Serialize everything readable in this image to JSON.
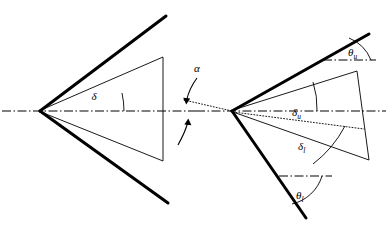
{
  "figure": {
    "background_color": "#ffffff",
    "line_color": "#000000",
    "canvas": {
      "width": 388,
      "height": 237
    }
  },
  "labels": {
    "delta": "δ",
    "alpha": "α",
    "delta_u_base": "δ",
    "delta_u_sub": "u",
    "delta_l_base": "δ",
    "delta_l_sub": "l",
    "theta_u_base": "θ",
    "theta_u_sub": "u",
    "theta_l_base": "θ",
    "theta_l_sub": "l"
  },
  "left_wedge": {
    "name": "symmetric-wedge",
    "apex": {
      "x": 40,
      "y": 111
    },
    "upper_surface_end": {
      "x": 166,
      "y": 16
    },
    "lower_surface_end": {
      "x": 168,
      "y": 203
    },
    "shock_upper_end": {
      "x": 163,
      "y": 57
    },
    "shock_lower_end": {
      "x": 163,
      "y": 161
    },
    "shock_closing_line": {
      "x": 163,
      "y1": 57,
      "y2": 161
    },
    "angle_label": "δ",
    "angle_arc_radius": 82,
    "axis_line": {
      "x1": 2,
      "y1": 111,
      "x2": 386,
      "y2": 111
    }
  },
  "alpha_marker": {
    "name": "angle-of-attack",
    "label": "α",
    "label_position": {
      "x": 196,
      "y": 69
    },
    "upper_arrow_tip": {
      "x": 186,
      "y": 101
    },
    "lower_arrow_tip": {
      "x": 188,
      "y": 121
    },
    "vertex": {
      "x": 196,
      "y": 111
    }
  },
  "right_wedge": {
    "name": "wedge-at-angle-of-attack",
    "apex": {
      "x": 232,
      "y": 111
    },
    "upper_surface_end": {
      "x": 369,
      "y": 34
    },
    "lower_surface_end": {
      "x": 306,
      "y": 218
    },
    "shock_upper_end": {
      "x": 357,
      "y": 71
    },
    "shock_lower_end": {
      "x": 369,
      "y": 160
    },
    "chord_dotted_end": {
      "x": 363,
      "y": 128
    },
    "theta_u_reference": {
      "x1": 325,
      "y1": 60,
      "x2": 374,
      "y2": 60
    },
    "theta_l_reference": {
      "x1": 281,
      "y1": 176,
      "x2": 330,
      "y2": 176
    }
  },
  "line_styles": {
    "surface": "thick-solid",
    "shock": "thin-solid",
    "axis": "dash-dot",
    "chord": "dotted"
  }
}
